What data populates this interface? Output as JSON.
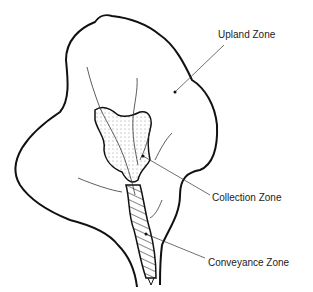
{
  "diagram": {
    "type": "watershed-zones",
    "labels": {
      "upland": "Upland Zone",
      "collection": "Collection Zone",
      "conveyance": "Conveyance Zone"
    },
    "colors": {
      "outline": "#111111",
      "text": "#222222",
      "background": "#ffffff"
    }
  }
}
